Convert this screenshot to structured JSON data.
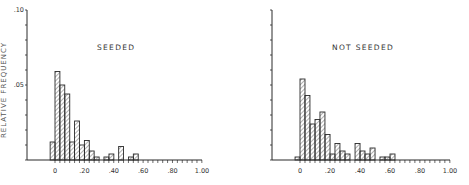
{
  "chart_data": [
    {
      "type": "bar",
      "title": "SEEDED",
      "xlabel": "",
      "ylabel": "RELATIVE FREQUENCY",
      "xlim": [
        -0.2,
        1.0
      ],
      "ylim": [
        0,
        0.1
      ],
      "x_ticks": [
        "0",
        ".20",
        ".40",
        ".60",
        ".80",
        "1.00"
      ],
      "y_ticks": [
        ".05",
        ".10"
      ],
      "bin_width": 0.0333,
      "bins": [
        {
          "x": -0.033,
          "value": 0.012
        },
        {
          "x": 0.0,
          "value": 0.059
        },
        {
          "x": 0.033,
          "value": 0.05
        },
        {
          "x": 0.067,
          "value": 0.044
        },
        {
          "x": 0.1,
          "value": 0.012
        },
        {
          "x": 0.133,
          "value": 0.026
        },
        {
          "x": 0.167,
          "value": 0.01
        },
        {
          "x": 0.2,
          "value": 0.013
        },
        {
          "x": 0.233,
          "value": 0.006
        },
        {
          "x": 0.267,
          "value": 0.002
        },
        {
          "x": 0.3,
          "value": 0.0
        },
        {
          "x": 0.333,
          "value": 0.002
        },
        {
          "x": 0.367,
          "value": 0.004
        },
        {
          "x": 0.4,
          "value": 0.0
        },
        {
          "x": 0.433,
          "value": 0.009
        },
        {
          "x": 0.467,
          "value": 0.0
        },
        {
          "x": 0.5,
          "value": 0.002
        },
        {
          "x": 0.533,
          "value": 0.004
        }
      ],
      "grid": false,
      "legend": "none"
    },
    {
      "type": "bar",
      "title": "NOT SEEDED",
      "xlabel": "",
      "ylabel": "",
      "xlim": [
        -0.2,
        1.0
      ],
      "ylim": [
        0,
        0.1
      ],
      "x_ticks": [
        "0",
        ".20",
        ".40",
        ".60",
        ".80",
        "1.00"
      ],
      "y_ticks": [],
      "bin_width": 0.0333,
      "bins": [
        {
          "x": -0.033,
          "value": 0.002
        },
        {
          "x": 0.0,
          "value": 0.054
        },
        {
          "x": 0.033,
          "value": 0.043
        },
        {
          "x": 0.067,
          "value": 0.024
        },
        {
          "x": 0.1,
          "value": 0.027
        },
        {
          "x": 0.133,
          "value": 0.032
        },
        {
          "x": 0.167,
          "value": 0.017
        },
        {
          "x": 0.2,
          "value": 0.004
        },
        {
          "x": 0.233,
          "value": 0.011
        },
        {
          "x": 0.267,
          "value": 0.006
        },
        {
          "x": 0.3,
          "value": 0.004
        },
        {
          "x": 0.333,
          "value": 0.0
        },
        {
          "x": 0.367,
          "value": 0.011
        },
        {
          "x": 0.4,
          "value": 0.006
        },
        {
          "x": 0.433,
          "value": 0.004
        },
        {
          "x": 0.467,
          "value": 0.008
        },
        {
          "x": 0.5,
          "value": 0.0
        },
        {
          "x": 0.533,
          "value": 0.002
        },
        {
          "x": 0.567,
          "value": 0.002
        },
        {
          "x": 0.6,
          "value": 0.004
        }
      ],
      "grid": false,
      "legend": "none"
    }
  ],
  "panels": {
    "left": {
      "title": "SEEDED",
      "ylabel": "RELATIVE FREQUENCY",
      "y_tick_labels": [
        ".10",
        ".05"
      ],
      "x_tick_labels": [
        "0",
        ".20",
        ".40",
        ".60",
        ".80",
        "1.00"
      ]
    },
    "right": {
      "title": "NOT SEEDED",
      "x_tick_labels": [
        "0",
        ".20",
        ".40",
        ".60",
        ".80",
        "1.00"
      ]
    }
  },
  "colors": {
    "ink": "#2a2a2a",
    "hatch": "#555555",
    "background": "#ffffff"
  }
}
